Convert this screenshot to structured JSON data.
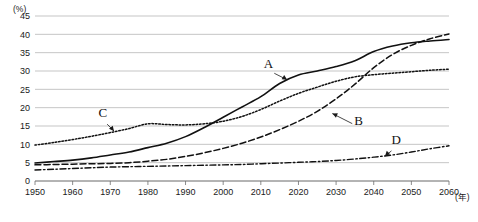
{
  "chart_data": {
    "type": "line",
    "title": "",
    "subtitle": "",
    "xlabel": "(年)",
    "ylabel": "(%)",
    "xlim": [
      1950,
      2060
    ],
    "ylim": [
      0,
      45
    ],
    "grid": true,
    "legend_position": "inline-annotations",
    "x_ticks": [
      1950,
      1960,
      1970,
      1980,
      1990,
      2000,
      2010,
      2020,
      2030,
      2040,
      2050,
      2060
    ],
    "y_ticks": [
      0,
      5,
      10,
      15,
      20,
      25,
      30,
      35,
      40,
      45
    ],
    "x": [
      1950,
      1955,
      1960,
      1965,
      1970,
      1975,
      1980,
      1985,
      1990,
      1995,
      2000,
      2005,
      2010,
      2015,
      2020,
      2025,
      2030,
      2035,
      2040,
      2045,
      2050,
      2055,
      2060
    ],
    "series": [
      {
        "name": "A",
        "style": "solid",
        "label": "A",
        "values": [
          4.9,
          5.3,
          5.7,
          6.3,
          7.1,
          7.9,
          9.1,
          10.3,
          12.1,
          14.6,
          17.4,
          20.2,
          23.0,
          26.6,
          28.9,
          30.0,
          31.2,
          32.8,
          35.3,
          36.8,
          37.7,
          38.2,
          38.6
        ]
      },
      {
        "name": "B",
        "style": "dashed",
        "label": "B",
        "values": [
          4.4,
          4.5,
          4.6,
          4.7,
          4.8,
          5.0,
          5.4,
          5.9,
          6.7,
          7.7,
          8.9,
          10.3,
          12.0,
          14.0,
          16.3,
          19.0,
          22.4,
          26.4,
          30.9,
          34.5,
          37.0,
          38.8,
          40.1
        ]
      },
      {
        "name": "C",
        "style": "dotted",
        "label": "C",
        "values": [
          9.8,
          10.5,
          11.3,
          12.2,
          13.2,
          14.3,
          15.6,
          15.4,
          15.3,
          15.6,
          16.3,
          17.6,
          19.5,
          21.8,
          23.9,
          25.6,
          27.2,
          28.4,
          29.0,
          29.4,
          29.8,
          30.2,
          30.5
        ]
      },
      {
        "name": "D",
        "style": "dashdot",
        "label": "D",
        "values": [
          3.0,
          3.2,
          3.4,
          3.6,
          3.8,
          3.9,
          4.0,
          4.1,
          4.2,
          4.3,
          4.4,
          4.5,
          4.7,
          4.9,
          5.1,
          5.3,
          5.6,
          6.0,
          6.5,
          7.1,
          7.9,
          8.8,
          9.6
        ]
      }
    ],
    "annotations": [
      {
        "label": "A",
        "label_x": 2012,
        "label_y": 30.8,
        "point_x": 2017,
        "point_y": 27.6
      },
      {
        "label": "B",
        "label_x": 2036,
        "label_y": 15.3,
        "point_x": 2029,
        "point_y": 18.4
      },
      {
        "label": "C",
        "label_x": 1968,
        "label_y": 17.4,
        "point_x": 1971,
        "point_y": 13.6
      },
      {
        "label": "D",
        "label_x": 2046,
        "label_y": 10.0,
        "point_x": 2043,
        "point_y": 6.8
      }
    ]
  },
  "colors": {
    "background": "#ffffff",
    "grid": "#aeaeae",
    "axis": "#6e6e6e",
    "series": "#111111",
    "text": "#1a1a1a"
  }
}
